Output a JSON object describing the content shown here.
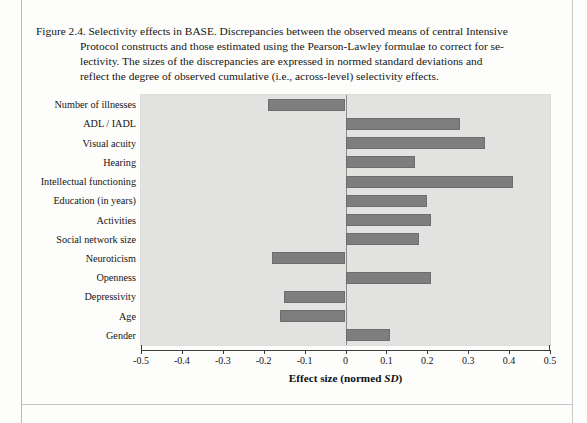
{
  "caption": {
    "figure_label": "Figure 2.4.",
    "lines": [
      "Figure 2.4. Selectivity effects in BASE. Discrepancies between the observed means of central Intensive",
      "Protocol constructs and those estimated using the Pearson-Lawley formulae to correct for se-",
      "lectivity. The sizes of the discrepancies are expressed in normed standard deviations and",
      "reflect the degree of observed cumulative (i.e., across-level) selectivity effects."
    ],
    "full_text": "Figure 2.4. Selectivity effects in BASE. Discrepancies between the observed means of central Intensive Protocol constructs and those estimated using the Pearson-Lawley formulae to correct for selectivity. The sizes of the discrepancies are expressed in normed standard deviations and reflect the degree of observed cumulative (i.e., across-level) selectivity effects."
  },
  "axis": {
    "x_title_main": "Effect size (normed ",
    "x_title_italic": "SD",
    "x_title_close": ")",
    "x_title_full": "Effect size (normed SD)",
    "tick_labels": [
      "-0.5",
      "-0.4",
      "-0.3",
      "-0.2",
      "-0.1",
      "0",
      "0.1",
      "0.2",
      "0.3",
      "0.4",
      "0.5"
    ],
    "tick_values": [
      -0.5,
      -0.4,
      -0.3,
      -0.2,
      -0.1,
      0,
      0.1,
      0.2,
      0.3,
      0.4,
      0.5
    ]
  },
  "colors": {
    "bar_fill": "#7e7e7e",
    "bar_stroke": "#6d6d6d",
    "plot_background": "#e2e3e1",
    "page_background": "#fdfdfb",
    "axis": "#3d3d3d",
    "text": "#151515"
  },
  "chart_data": {
    "type": "bar",
    "orientation": "horizontal",
    "title": "Figure 2.4. Selectivity effects in BASE",
    "xlabel": "Effect size (normed SD)",
    "ylabel": "",
    "xlim": [
      -0.5,
      0.5
    ],
    "xticks": [
      -0.5,
      -0.4,
      -0.3,
      -0.2,
      -0.1,
      0,
      0.1,
      0.2,
      0.3,
      0.4,
      0.5
    ],
    "grid": false,
    "legend": false,
    "categories": [
      "Number of illnesses",
      "ADL / IADL",
      "Visual acuity",
      "Hearing",
      "Intellectual functioning",
      "Education (in years)",
      "Activities",
      "Social network size",
      "Neuroticism",
      "Openness",
      "Depressivity",
      "Age",
      "Gender"
    ],
    "values": [
      -0.19,
      0.28,
      0.34,
      0.17,
      0.41,
      0.2,
      0.21,
      0.18,
      -0.18,
      0.21,
      -0.15,
      -0.16,
      0.11
    ]
  }
}
